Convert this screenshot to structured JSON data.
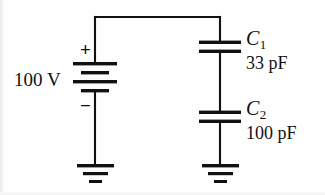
{
  "figure": {
    "kind": "circuit-schematic",
    "width": 325,
    "height": 195,
    "background_color": "#fefefe",
    "line_color": "#111111"
  },
  "source": {
    "label": "battery-dc-voltage-source",
    "value_label": "100 V",
    "positive_terminal_label": "+",
    "negative_terminal_label": "−",
    "plate_count": 4
  },
  "capacitors": [
    {
      "name": "C",
      "subscript": "1",
      "value_label": "33 pF",
      "value": 33,
      "unit": "pF"
    },
    {
      "name": "C",
      "subscript": "2",
      "value_label": "100 pF",
      "value": 100,
      "unit": "pF"
    }
  ],
  "grounds": [
    {
      "label": "ground-left",
      "bars": 3
    },
    {
      "label": "ground-right",
      "bars": 3
    }
  ],
  "wires": {
    "top_rail_label": "top-connecting-wire",
    "left_branch_label": "source-branch-wire",
    "right_branch_label": "capacitor-branch-wire"
  }
}
